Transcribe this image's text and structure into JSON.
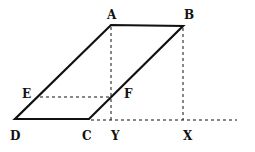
{
  "diagram": {
    "type": "geometry",
    "points": {
      "A": {
        "label": "A",
        "x": 111,
        "y": 25
      },
      "B": {
        "label": "B",
        "x": 183,
        "y": 26
      },
      "C": {
        "label": "C",
        "x": 89,
        "y": 119
      },
      "D": {
        "label": "D",
        "x": 15,
        "y": 119
      },
      "E": {
        "label": "E",
        "x": 40,
        "y": 97
      },
      "F": {
        "label": "F",
        "x": 111,
        "y": 97
      },
      "X": {
        "label": "X",
        "x": 183,
        "y": 120
      },
      "Y": {
        "label": "Y",
        "x": 111,
        "y": 120
      }
    },
    "solid_segments": [
      "AB",
      "BC",
      "CD",
      "DA"
    ],
    "dashed_segments": [
      "AY",
      "BX",
      "EF",
      "C-extension"
    ],
    "colors": {
      "line": "#111111",
      "background": "#ffffff"
    }
  }
}
